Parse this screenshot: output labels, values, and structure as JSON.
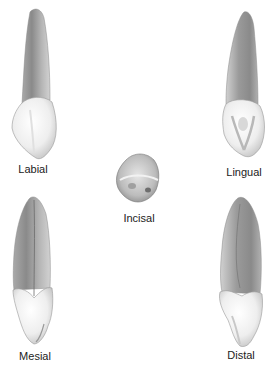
{
  "figure": {
    "views": [
      {
        "id": "labial",
        "label": "Labial"
      },
      {
        "id": "lingual",
        "label": "Lingual"
      },
      {
        "id": "incisal",
        "label": "Incisal"
      },
      {
        "id": "mesial",
        "label": "Mesial"
      },
      {
        "id": "distal",
        "label": "Distal"
      }
    ]
  },
  "colors": {
    "root_dark": "#8c8c8c",
    "root_light": "#c8c8c8",
    "crown_light": "#f4f4f4",
    "crown_shade": "#cfcfcf",
    "label_text": "#222222",
    "background": "#ffffff"
  }
}
